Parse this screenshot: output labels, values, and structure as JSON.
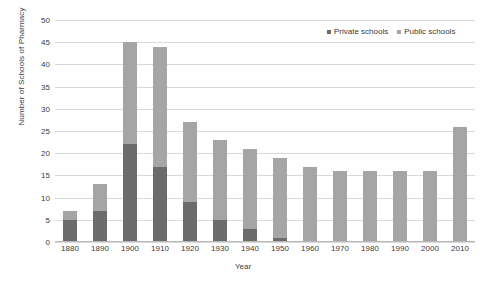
{
  "chart_data": {
    "type": "bar",
    "subtype": "stacked-column",
    "title": "",
    "xlabel": "Year",
    "ylabel": "Number of Schools of Pharmacy",
    "categories": [
      "1880",
      "1890",
      "1900",
      "1910",
      "1920",
      "1930",
      "1940",
      "1950",
      "1960",
      "1970",
      "1980",
      "1990",
      "2000",
      "2010"
    ],
    "series": [
      {
        "name": "Private schools",
        "color": "#6b6b6b",
        "values": [
          5,
          7,
          22,
          17,
          9,
          5,
          3,
          1,
          0,
          0,
          0,
          0,
          0,
          0
        ]
      },
      {
        "name": "Public schools",
        "color": "#a5a5a5",
        "values": [
          2,
          6,
          23,
          27,
          18,
          18,
          18,
          18,
          17,
          16,
          16,
          16,
          16,
          26
        ]
      }
    ],
    "totals": [
      7,
      13,
      45,
      44,
      27,
      23,
      21,
      19,
      17,
      16,
      16,
      16,
      16,
      26
    ],
    "ylim": [
      0,
      50
    ],
    "yticks": [
      0,
      5,
      10,
      15,
      20,
      25,
      30,
      35,
      40,
      45,
      50
    ],
    "grid": true,
    "legend_position": "top-right"
  },
  "legend": {
    "items": [
      {
        "label": "Private schools",
        "color": "#6b6b6b"
      },
      {
        "label": "Public schools",
        "color": "#a5a5a5"
      }
    ]
  }
}
